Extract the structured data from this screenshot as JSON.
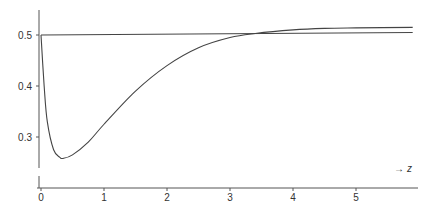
{
  "chart_data": {
    "type": "line",
    "title": "",
    "xlabel": "z",
    "xlabel_display": "→ z",
    "ylabel": "",
    "x_ticks": [
      "0",
      "1",
      "2",
      "3",
      "4",
      "5"
    ],
    "y_ticks": [
      "0.3",
      "0.4",
      "0.5"
    ],
    "xlim": [
      0,
      5.9
    ],
    "ylim": [
      0.24,
      0.55
    ],
    "grid": false,
    "legend": null,
    "series": [
      {
        "name": "curve",
        "x": [
          0,
          0.05,
          0.1,
          0.2,
          0.3,
          0.35,
          0.5,
          0.75,
          1.0,
          1.5,
          2.0,
          2.5,
          3.0,
          3.4,
          4.0,
          4.5,
          5.0,
          5.9
        ],
        "y": [
          0.5,
          0.4,
          0.33,
          0.275,
          0.26,
          0.258,
          0.265,
          0.29,
          0.325,
          0.39,
          0.44,
          0.475,
          0.495,
          0.503,
          0.51,
          0.513,
          0.514,
          0.515
        ]
      },
      {
        "name": "reference line",
        "x": [
          0,
          5.9
        ],
        "y": [
          0.5,
          0.505
        ]
      }
    ]
  }
}
